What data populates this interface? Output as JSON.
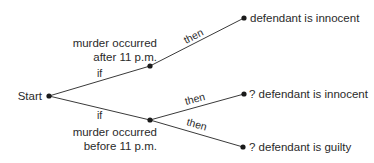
{
  "diagram": {
    "type": "decision-tree",
    "nodes": {
      "start": {
        "label": "Start",
        "x": 49,
        "y": 96
      },
      "after": {
        "label_line1": "murder occurred",
        "label_line2": "after 11 p.m.",
        "x": 150,
        "y": 66
      },
      "before": {
        "label_line1": "murder occurred",
        "label_line2": "before 11 p.m.",
        "x": 150,
        "y": 120
      },
      "innocent": {
        "label": "defendant is innocent",
        "x": 244,
        "y": 18
      },
      "maybe_innocent": {
        "label": "? defendant is innocent",
        "x": 244,
        "y": 94
      },
      "maybe_guilty": {
        "label": "? defendant is guilty",
        "x": 243,
        "y": 147
      }
    },
    "edges": [
      {
        "from": "start",
        "to": "after",
        "label": "if"
      },
      {
        "from": "start",
        "to": "before",
        "label": "if"
      },
      {
        "from": "after",
        "to": "innocent",
        "label": "then"
      },
      {
        "from": "before",
        "to": "maybe_innocent",
        "label": "then"
      },
      {
        "from": "before",
        "to": "maybe_guilty",
        "label": "then"
      }
    ]
  }
}
